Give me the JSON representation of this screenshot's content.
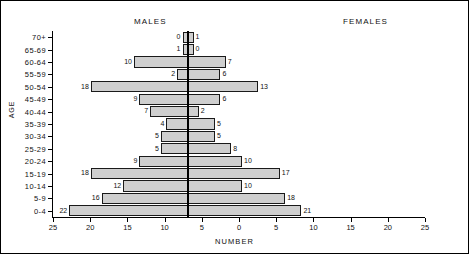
{
  "headers": {
    "males": "MALES",
    "females": "FEMALES"
  },
  "axes": {
    "x_label": "NUMBER",
    "y_label": "AGE",
    "x_ticks": [
      "25",
      "20",
      "15",
      "10",
      "5",
      "0",
      "5",
      "10",
      "15",
      "20",
      "25"
    ]
  },
  "chart_data": {
    "type": "bar",
    "subtype": "population-pyramid",
    "title": "",
    "xlabel": "NUMBER",
    "ylabel": "AGE",
    "xlim": [
      -25,
      25
    ],
    "x_tick_values": [
      25,
      20,
      15,
      10,
      5,
      0,
      5,
      10,
      15,
      20,
      25
    ],
    "grid": false,
    "legend_position": "top",
    "categories": [
      "70+",
      "65-69",
      "60-64",
      "55-59",
      "50-54",
      "45-49",
      "40-44",
      "35-39",
      "30-34",
      "25-29",
      "20-24",
      "15-19",
      "10-14",
      "5-9",
      "0-4"
    ],
    "series": [
      {
        "name": "MALES",
        "side": "left",
        "values": [
          0,
          1,
          10,
          2,
          18,
          9,
          7,
          4,
          5,
          5,
          9,
          18,
          12,
          16,
          22
        ]
      },
      {
        "name": "FEMALES",
        "side": "right",
        "values": [
          1,
          0,
          7,
          6,
          13,
          6,
          2,
          5,
          5,
          8,
          10,
          17,
          10,
          18,
          21
        ]
      }
    ]
  }
}
